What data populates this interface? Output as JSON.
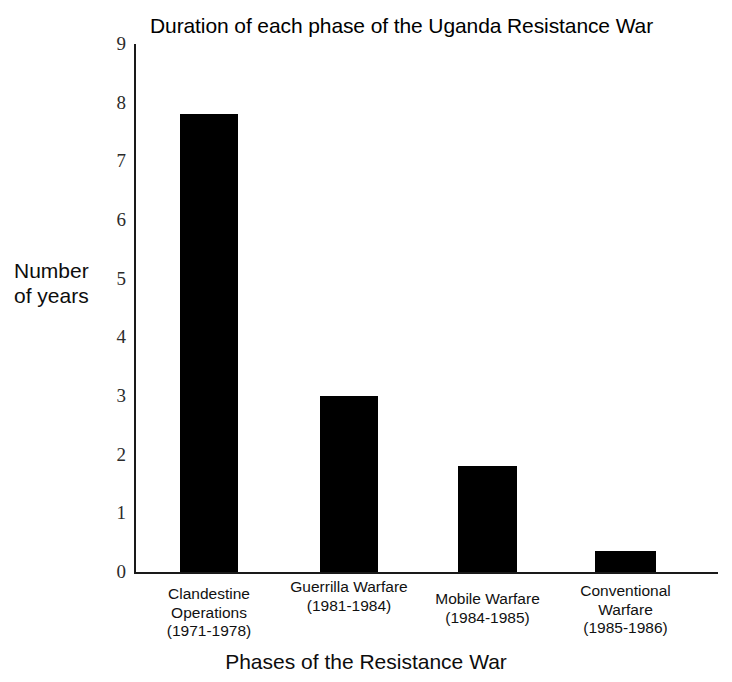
{
  "chart_data": {
    "type": "bar",
    "title": "Duration of each phase of the Uganda Resistance War",
    "xlabel": "Phases of the Resistance War",
    "ylabel": "Number of years",
    "ylabel_lines": [
      "Number",
      "of years"
    ],
    "categories": [
      "Clandestine Operations (1971-1978)",
      "Guerrilla Warfare (1981-1984)",
      "Mobile Warfare (1984-1985)",
      "Conventional Warfare (1985-1986)"
    ],
    "category_lines": [
      [
        "Clandestine",
        "Operations",
        "(1971-1978)"
      ],
      [
        "Guerrilla Warfare",
        "(1981-1984)"
      ],
      [
        "Mobile Warfare",
        "(1984-1985)"
      ],
      [
        "Conventional",
        "Warfare",
        "(1985-1986)"
      ]
    ],
    "values": [
      7.8,
      3.0,
      1.8,
      0.35
    ],
    "ylim": [
      0,
      9
    ],
    "yticks": [
      0,
      1,
      2,
      3,
      4,
      5,
      6,
      7,
      8,
      9
    ],
    "ytick_labels": [
      "0",
      "1",
      "2",
      "3",
      "4",
      "5",
      "6",
      "7",
      "8",
      "9"
    ],
    "grid": false,
    "legend": false,
    "bar_color": "#000000",
    "axis_color": "#1a1a1a",
    "background": "#ffffff"
  }
}
